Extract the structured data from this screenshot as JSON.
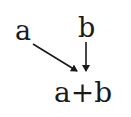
{
  "diagram": {
    "nodes": [
      {
        "id": "a",
        "label": "a"
      },
      {
        "id": "b",
        "label": "b"
      },
      {
        "id": "sum",
        "label": "a+b"
      }
    ],
    "edges": [
      {
        "from": "a",
        "to": "sum",
        "style": "diagonal-arrow"
      },
      {
        "from": "b",
        "to": "sum",
        "style": "vertical-arrow"
      }
    ],
    "colors": {
      "text": "#1a1a1a",
      "arrow": "#1a1a1a",
      "background": "#ffffff"
    }
  }
}
